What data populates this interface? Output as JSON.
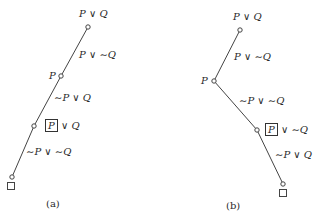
{
  "figures": [
    {
      "id": "a",
      "caption": "(a)",
      "nodes": [
        {
          "label": "P ∨ Q",
          "x": 88,
          "y": 27
        },
        {
          "label": "P",
          "x": 61,
          "y": 76
        },
        {
          "label": "[P] ∨ Q",
          "x": 34,
          "y": 126
        },
        {
          "label": "",
          "x": 12,
          "y": 177
        }
      ],
      "edge_labels": [
        "P ∨ ∼Q",
        "∼P ∨ Q",
        "∼P ∨ ∼Q"
      ],
      "terminal": "□"
    },
    {
      "id": "b",
      "caption": "(b)",
      "nodes": [
        {
          "label": "P ∨ Q",
          "x": 240,
          "y": 30
        },
        {
          "label": "P",
          "x": 214,
          "y": 81
        },
        {
          "label": "[P] ∨ ∼Q",
          "x": 257,
          "y": 130
        },
        {
          "label": "",
          "x": 283,
          "y": 184
        }
      ],
      "edge_labels": [
        "P ∨ ∼Q",
        "∼P ∨ ∼Q",
        "∼P ∨ Q"
      ],
      "terminal": "□"
    }
  ],
  "text": {
    "a_top": "P ∨ Q",
    "a_e1": "P ∨ ∼Q",
    "a_p": "P",
    "a_e2": "∼P ∨ Q",
    "a_box": "P",
    "a_boxrest": "∨ Q",
    "a_e3": "∼P ∨ ∼Q",
    "a_term": "□",
    "a_cap": "(a)",
    "b_top": "P ∨ Q",
    "b_e1": "P ∨ ∼Q",
    "b_p": "P",
    "b_e2": "∼P ∨ ∼Q",
    "b_box": "P",
    "b_boxrest": "∨ ∼Q",
    "b_e3": "∼P ∨ Q",
    "b_term": "□",
    "b_cap": "(b)"
  }
}
